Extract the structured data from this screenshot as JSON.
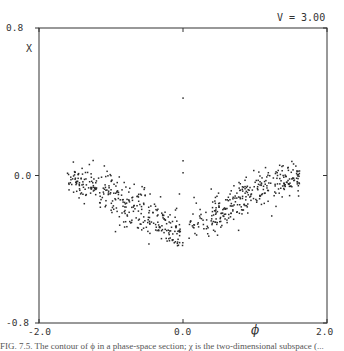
{
  "chart_data": {
    "type": "scatter",
    "title": "",
    "annotation": "V = 3.00",
    "xlabel": "ϕ",
    "ylabel": "X",
    "xlim": [
      -2.0,
      2.0
    ],
    "ylim": [
      -0.8,
      0.8
    ],
    "x_ticks": [
      {
        "value": -2.0,
        "label": "-2.0"
      },
      {
        "value": 0.0,
        "label": "0.0"
      },
      {
        "value": 2.0,
        "label": "2.0"
      }
    ],
    "y_ticks": [
      {
        "value": 0.8,
        "label": "0.8"
      },
      {
        "value": 0.0,
        "label": "0.0"
      },
      {
        "value": -0.8,
        "label": "-0.8"
      }
    ],
    "grid": false,
    "legend": "none",
    "series": [
      {
        "name": "isolated",
        "points": [
          [
            0.0,
            0.42
          ],
          [
            0.0,
            0.08
          ],
          [
            0.0,
            0.015
          ],
          [
            -0.05,
            -0.1
          ]
        ]
      },
      {
        "name": "left-wing",
        "generator": {
          "phi_range": [
            -1.6,
            -0.02
          ],
          "chi_start": -0.01,
          "chi_end": -0.33,
          "spread": 0.045,
          "count": 330,
          "seed": 7
        }
      },
      {
        "name": "right-wing",
        "generator": {
          "phi_range": [
            0.05,
            1.62
          ],
          "chi_start": -0.31,
          "chi_end": 0.0,
          "spread": 0.045,
          "count": 310,
          "seed": 11
        }
      }
    ]
  },
  "caption": "FIG. 7.5. The contour of ϕ in a phase-space section; χ is the two-dimensional subspace (..."
}
